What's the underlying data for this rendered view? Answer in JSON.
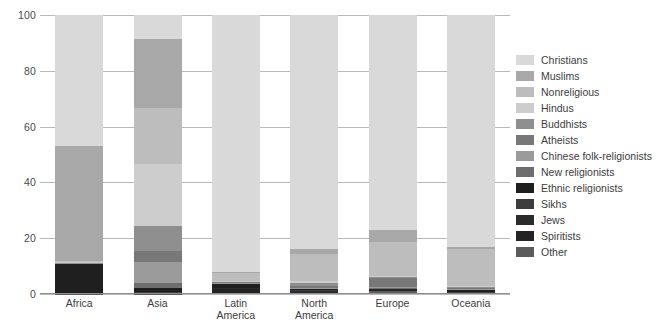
{
  "chart_data": {
    "type": "bar",
    "title": "",
    "subtitle": "",
    "xlabel": "",
    "ylabel": "",
    "ylim": [
      0,
      100
    ],
    "yticks": [
      0,
      20,
      40,
      60,
      80,
      100
    ],
    "ytick_labels": [
      "0",
      "20",
      "40",
      "60",
      "80",
      "100"
    ],
    "grid": true,
    "stacked": true,
    "legend_position": "right",
    "categories": [
      "Africa",
      "Asia",
      "Latin America",
      "North America",
      "Europe",
      "Oceania"
    ],
    "category_lines": [
      [
        "Africa"
      ],
      [
        "Asia"
      ],
      [
        "Latin",
        "America"
      ],
      [
        "North",
        "America"
      ],
      [
        "Europe"
      ],
      [
        "Oceania"
      ]
    ],
    "series": [
      {
        "name": "Christians",
        "color": "#d9d9d9",
        "values": [
          47.0,
          8.5,
          92.0,
          84.0,
          77.0,
          83.0
        ]
      },
      {
        "name": "Muslims",
        "color": "#a8a8a8",
        "values": [
          41.0,
          25.0,
          0.3,
          1.5,
          4.5,
          1.0
        ]
      },
      {
        "name": "Nonreligious",
        "color": "#bdbdbd",
        "values": [
          0.5,
          20.0,
          3.0,
          10.0,
          12.0,
          13.0
        ]
      },
      {
        "name": "Hindus",
        "color": "#cdcdcd",
        "values": [
          0.2,
          22.0,
          0.2,
          0.7,
          0.3,
          0.4
        ]
      },
      {
        "name": "Buddhists",
        "color": "#8f8f8f",
        "values": [
          0.1,
          9.0,
          0.2,
          0.9,
          0.3,
          0.4
        ]
      },
      {
        "name": "Atheists",
        "color": "#787878",
        "values": [
          0.1,
          4.0,
          0.3,
          0.6,
          3.5,
          0.3
        ]
      },
      {
        "name": "Chinese folk-religionists",
        "color": "#9b9b9b",
        "values": [
          0.0,
          7.5,
          0.1,
          0.2,
          0.1,
          0.2
        ]
      },
      {
        "name": "New religionists",
        "color": "#6e6e6e",
        "values": [
          0.0,
          1.8,
          0.1,
          0.2,
          0.1,
          0.2
        ]
      },
      {
        "name": "Ethnic religionists",
        "color": "#1f1f1f",
        "values": [
          11.0,
          1.5,
          1.6,
          0.4,
          0.2,
          0.6
        ]
      },
      {
        "name": "Sikhs",
        "color": "#3d3d3d",
        "values": [
          0.0,
          0.4,
          0.0,
          0.2,
          0.2,
          0.1
        ]
      },
      {
        "name": "Jews",
        "color": "#2b2b2b",
        "values": [
          0.0,
          0.2,
          0.2,
          0.8,
          0.5,
          0.1
        ]
      },
      {
        "name": "Spiritists",
        "color": "#232323",
        "values": [
          0.0,
          0.0,
          1.5,
          0.2,
          0.1,
          0.1
        ]
      },
      {
        "name": "Other",
        "color": "#5c5c5c",
        "values": [
          0.1,
          0.1,
          0.5,
          0.3,
          1.2,
          0.6
        ]
      }
    ]
  },
  "axis": {
    "y_tick_labels": [
      "100",
      "80",
      "60",
      "40",
      "20",
      "0"
    ]
  },
  "legend": {
    "items": [
      {
        "label": "Christians",
        "color": "#d9d9d9"
      },
      {
        "label": "Muslims",
        "color": "#a8a8a8"
      },
      {
        "label": "Nonreligious",
        "color": "#bdbdbd"
      },
      {
        "label": "Hindus",
        "color": "#cdcdcd"
      },
      {
        "label": "Buddhists",
        "color": "#8f8f8f"
      },
      {
        "label": "Atheists",
        "color": "#787878"
      },
      {
        "label": "Chinese folk-religionists",
        "color": "#9b9b9b"
      },
      {
        "label": "New religionists",
        "color": "#6e6e6e"
      },
      {
        "label": "Ethnic religionists",
        "color": "#1f1f1f"
      },
      {
        "label": "Sikhs",
        "color": "#3d3d3d"
      },
      {
        "label": "Jews",
        "color": "#2b2b2b"
      },
      {
        "label": "Spiritists",
        "color": "#232323"
      },
      {
        "label": "Other",
        "color": "#5c5c5c"
      }
    ]
  }
}
